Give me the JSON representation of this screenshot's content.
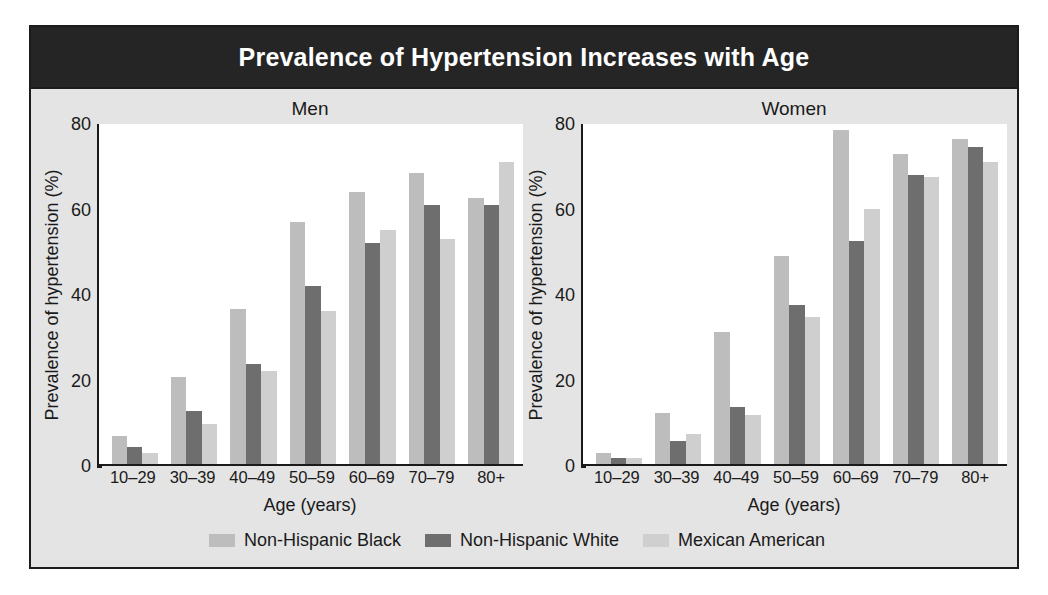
{
  "figure": {
    "title": "Prevalence of Hypertension Increases with Age",
    "panel_bg": "#e4e4e4",
    "banner_bg": "#252525",
    "banner_fg": "#ffffff"
  },
  "legend": {
    "items": [
      {
        "label": "Non-Hispanic Black",
        "color": "#bdbdbd"
      },
      {
        "label": "Non-Hispanic White",
        "color": "#6e6e6e"
      },
      {
        "label": "Mexican American",
        "color": "#cfcfcf"
      }
    ]
  },
  "chart_data": [
    {
      "type": "bar",
      "title": "Men",
      "xlabel": "Age (years)",
      "ylabel": "Prevalence of hypertension (%)",
      "ylim": [
        0,
        80
      ],
      "yticks": [
        0,
        20,
        40,
        60,
        80
      ],
      "grid": false,
      "legend_position": "bottom-center-shared",
      "categories": [
        "10–29",
        "30–39",
        "40–49",
        "50–59",
        "60–69",
        "70–79",
        "80+"
      ],
      "series": [
        {
          "name": "Non-Hispanic Black",
          "color": "#bdbdbd",
          "values": [
            6.5,
            20.5,
            36.5,
            57,
            64,
            68.5,
            62.5
          ]
        },
        {
          "name": "Non-Hispanic White",
          "color": "#6e6e6e",
          "values": [
            4,
            12.5,
            23.5,
            42,
            52,
            61,
            61
          ]
        },
        {
          "name": "Mexican American",
          "color": "#cfcfcf",
          "values": [
            2.5,
            9.5,
            22,
            36,
            55,
            53,
            71
          ]
        }
      ]
    },
    {
      "type": "bar",
      "title": "Women",
      "xlabel": "Age (years)",
      "ylabel": "Prevalence of hypertension (%)",
      "ylim": [
        0,
        80
      ],
      "yticks": [
        0,
        20,
        40,
        60,
        80
      ],
      "grid": false,
      "legend_position": "bottom-center-shared",
      "categories": [
        "10–29",
        "30–39",
        "40–49",
        "50–59",
        "60–69",
        "70–79",
        "80+"
      ],
      "series": [
        {
          "name": "Non-Hispanic Black",
          "color": "#bdbdbd",
          "values": [
            2.5,
            12,
            31,
            49,
            78.5,
            73,
            76.5
          ]
        },
        {
          "name": "Non-Hispanic White",
          "color": "#6e6e6e",
          "values": [
            1.5,
            5.5,
            13.5,
            37.5,
            52.5,
            68,
            74.5
          ]
        },
        {
          "name": "Mexican American",
          "color": "#cfcfcf",
          "values": [
            1.5,
            7,
            11.5,
            34.5,
            60,
            67.5,
            71
          ]
        }
      ]
    }
  ]
}
